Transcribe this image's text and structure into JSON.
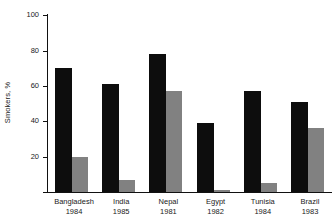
{
  "chart_data": {
    "type": "bar",
    "title": "",
    "xlabel": "",
    "ylabel": "Smokers, %",
    "ylim": [
      0,
      100
    ],
    "yticks": [
      0,
      20,
      40,
      60,
      80,
      100
    ],
    "ytick_labels": [
      "",
      "20",
      "40",
      "60",
      "80",
      "100"
    ],
    "grid": false,
    "legend": "none",
    "categories": [
      "Bangladesh",
      "India",
      "Nepal",
      "Egypt",
      "Tunisia",
      "Brazil"
    ],
    "category_years": [
      "1984",
      "1985",
      "1981",
      "1982",
      "1984",
      "1983"
    ],
    "series": [
      {
        "name": "men",
        "color": "#0d0d0d",
        "values": [
          70,
          61,
          78,
          39,
          57,
          51
        ]
      },
      {
        "name": "women",
        "color": "#818181",
        "values": [
          20,
          7,
          57,
          1,
          5,
          36
        ]
      }
    ]
  },
  "axis": {
    "y_label": "Smokers, %",
    "tick_100": "100",
    "tick_80": "80",
    "tick_60": "60",
    "tick_40": "40",
    "tick_20": "20"
  },
  "categories": [
    {
      "name": "Bangladesh",
      "year": "1984"
    },
    {
      "name": "India",
      "year": "1985"
    },
    {
      "name": "Nepal",
      "year": "1981"
    },
    {
      "name": "Egypt",
      "year": "1982"
    },
    {
      "name": "Tunisia",
      "year": "1984"
    },
    {
      "name": "Brazil",
      "year": "1983"
    }
  ],
  "colors": {
    "dark_bar": "#0d0d0d",
    "light_bar": "#818181",
    "axis": "#111111",
    "background": "#ffffff"
  }
}
